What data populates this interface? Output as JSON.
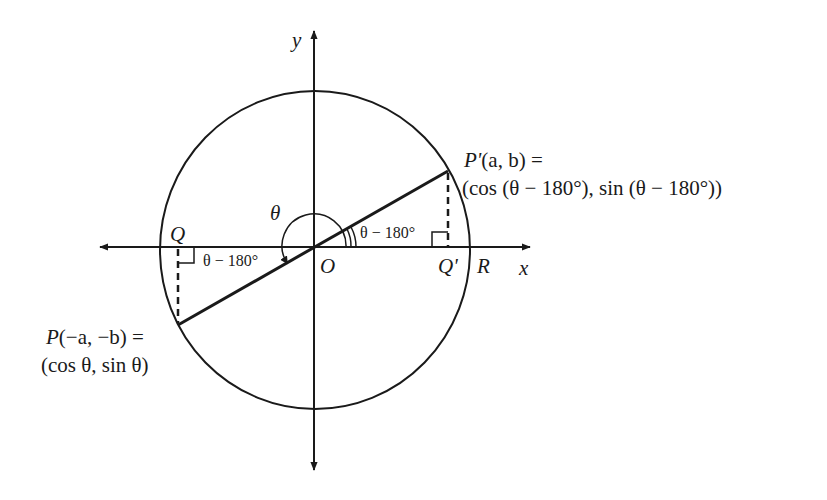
{
  "diagram": {
    "type": "unit-circle-reference-angle",
    "colors": {
      "stroke": "#1a1a1a",
      "background": "#ffffff"
    },
    "axes": {
      "x_label": "x",
      "y_label": "y"
    },
    "points": {
      "origin": "O",
      "Q": "Q",
      "Q_prime": "Q'",
      "R": "R"
    },
    "angle_labels": {
      "theta": "θ",
      "reference_angle_right": "θ − 180°",
      "reference_angle_left": "θ − 180°"
    },
    "P_prime": {
      "name": "P'",
      "coords": "(a, b) =",
      "value": "(cos (θ − 180°), sin (θ − 180°))"
    },
    "P": {
      "name": "P",
      "coords": "(−a, −b) =",
      "value": "(cos θ, sin θ)"
    }
  }
}
